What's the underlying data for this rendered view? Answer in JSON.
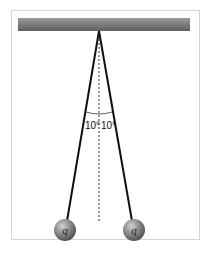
{
  "diagram": {
    "title": "",
    "angle_left_label": "10°",
    "angle_right_label": "10°",
    "charge_left_label": "q",
    "charge_right_label": "q",
    "colors": {
      "frame": "#d8d8d8",
      "bar": "#7a7a7a",
      "string": "#111111",
      "sphere": "#8a8a8a",
      "centerline": "#333333"
    }
  }
}
